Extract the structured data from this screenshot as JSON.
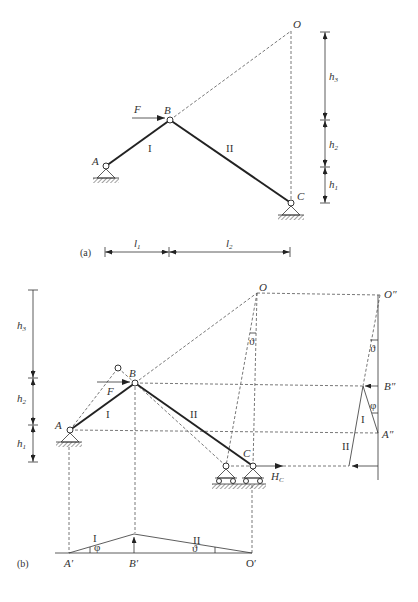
{
  "figure_a": {
    "caption": "(a)",
    "points": {
      "A": "A",
      "B": "B",
      "C": "C",
      "O": "O"
    },
    "force": "F",
    "members": {
      "one": "I",
      "two": "II"
    },
    "heights": {
      "h1": "h",
      "h1_sub": "1",
      "h2": "h",
      "h2_sub": "2",
      "h3": "h",
      "h3_sub": "3"
    },
    "lengths": {
      "l1": "l",
      "l1_sub": "1",
      "l2": "l",
      "l2_sub": "2"
    }
  },
  "figure_b": {
    "caption": "(b)",
    "points": {
      "A": "A",
      "B": "B",
      "C": "C",
      "O": "O",
      "O_dd": "O″",
      "B_dd": "B″",
      "A_dd": "A″",
      "A_p": "A′",
      "B_p": "B′",
      "O_p": "O′"
    },
    "force": "F",
    "reaction": "H",
    "reaction_sub": "C",
    "members": {
      "one": "I",
      "two": "II"
    },
    "angles": {
      "phi": "φ",
      "theta": "ϑ"
    },
    "heights": {
      "h1": "h",
      "h1_sub": "1",
      "h2": "h",
      "h2_sub": "2",
      "h3": "h",
      "h3_sub": "3"
    }
  }
}
